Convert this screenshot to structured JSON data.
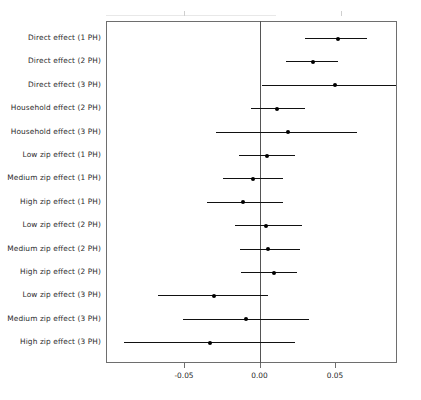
{
  "chart_data": {
    "type": "scatter",
    "title": "",
    "subtitle": "",
    "xlabel": "",
    "ylabel": "",
    "orientation": "horizontal",
    "plot_style": "forest-plot",
    "grid": false,
    "legend": "none",
    "reference_line": 0.0,
    "xlim": [
      -0.1017,
      0.0909
    ],
    "xticks": [
      -0.05,
      0.0,
      0.05
    ],
    "xticklabels": [
      "-0.05",
      "0.00",
      "0.05"
    ],
    "categories": [
      "Direct effect (1 PH)",
      "Direct effect (2 PH)",
      "Direct effect (3 PH)",
      "Household effect (2 PH)",
      "Household effect (3 PH)",
      "Low zip effect (1 PH)",
      "Medium zip effect (1 PH)",
      "High zip effect (1 PH)",
      "Low zip effect (2 PH)",
      "Medium zip effect (2 PH)",
      "High zip effect (2 PH)",
      "Low zip effect (3 PH)",
      "Medium zip effect (3 PH)",
      "High zip effect (3 PH)"
    ],
    "points": [
      {
        "label": "Direct effect (1 PH)",
        "estimate": 0.0519,
        "ci_low": 0.0301,
        "ci_high": 0.0712
      },
      {
        "label": "Direct effect (2 PH)",
        "estimate": 0.0354,
        "ci_low": 0.0175,
        "ci_high": 0.052
      },
      {
        "label": "Direct effect (3 PH)",
        "estimate": 0.05,
        "ci_low": 0.0017,
        "ci_high": 0.0909
      },
      {
        "label": "Household effect (2 PH)",
        "estimate": 0.0116,
        "ci_low": -0.0056,
        "ci_high": 0.0301
      },
      {
        "label": "Household effect (3 PH)",
        "estimate": 0.0189,
        "ci_low": -0.0288,
        "ci_high": 0.0646
      },
      {
        "label": "Low zip effect (1 PH)",
        "estimate": 0.005,
        "ci_low": -0.0136,
        "ci_high": 0.0235
      },
      {
        "label": "Medium zip effect (1 PH)",
        "estimate": -0.0043,
        "ci_low": -0.0242,
        "ci_high": 0.0155
      },
      {
        "label": "High zip effect (1 PH)",
        "estimate": -0.0109,
        "ci_low": -0.0348,
        "ci_high": 0.0155
      },
      {
        "label": "Low zip effect (2 PH)",
        "estimate": 0.0043,
        "ci_low": -0.0162,
        "ci_high": 0.0281
      },
      {
        "label": "Medium zip effect (2 PH)",
        "estimate": 0.0056,
        "ci_low": -0.0129,
        "ci_high": 0.0268
      },
      {
        "label": "High zip effect (2 PH)",
        "estimate": 0.0096,
        "ci_low": -0.0123,
        "ci_high": 0.0248
      },
      {
        "label": "Low zip effect (3 PH)",
        "estimate": -0.0301,
        "ci_low": -0.0672,
        "ci_high": 0.0056
      },
      {
        "label": "Medium zip effect (3 PH)",
        "estimate": -0.0089,
        "ci_low": -0.0507,
        "ci_high": 0.0328
      },
      {
        "label": "High zip effect (3 PH)",
        "estimate": -0.0328,
        "ci_low": -0.0897,
        "ci_high": 0.0235
      }
    ],
    "colors": {
      "point": "#000000",
      "interval": "#111111",
      "axis": "#6e6e6e",
      "reference": "#555555",
      "background": "#ffffff",
      "text": "#2b2b2b"
    }
  },
  "geometry": {
    "frame": {
      "left": 106,
      "top": 21,
      "width": 291,
      "height": 342
    },
    "x_px_at_zero": 259.5,
    "px_per_unit": 1510,
    "row_top": 38,
    "row_step": 23.4
  }
}
